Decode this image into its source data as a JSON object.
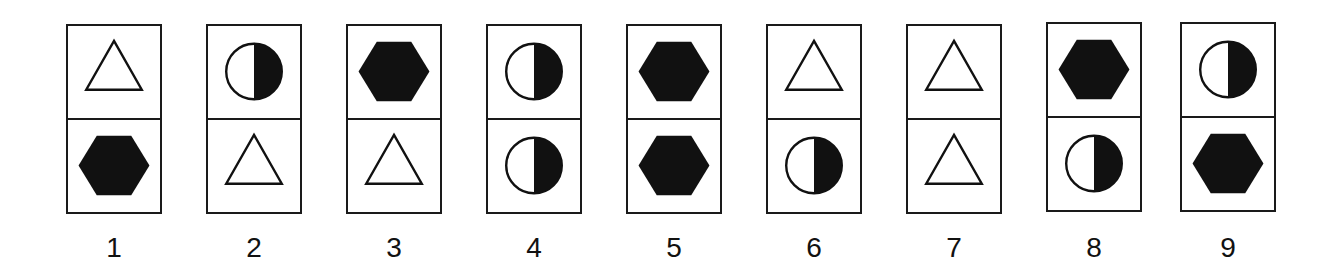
{
  "colors": {
    "ink": "#111111",
    "paper": "#ffffff"
  },
  "cards": [
    {
      "label": "1",
      "top": "triangle-outline",
      "bottom": "hexagon-filled"
    },
    {
      "label": "2",
      "top": "half-circle",
      "bottom": "triangle-outline"
    },
    {
      "label": "3",
      "top": "hexagon-filled",
      "bottom": "triangle-outline"
    },
    {
      "label": "4",
      "top": "half-circle",
      "bottom": "half-circle"
    },
    {
      "label": "5",
      "top": "hexagon-filled",
      "bottom": "hexagon-filled"
    },
    {
      "label": "6",
      "top": "triangle-outline",
      "bottom": "half-circle"
    },
    {
      "label": "7",
      "top": "triangle-outline",
      "bottom": "triangle-outline"
    },
    {
      "label": "8",
      "top": "hexagon-filled",
      "bottom": "half-circle"
    },
    {
      "label": "9",
      "top": "half-circle",
      "bottom": "hexagon-filled"
    }
  ]
}
